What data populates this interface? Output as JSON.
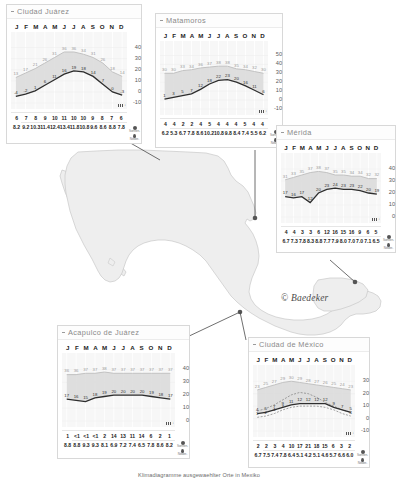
{
  "map": {
    "region_name": "Mexico",
    "copyright": "Baedeker",
    "copyright_mark": "©",
    "caption": "Klimadiagramme ausgewaehlter Orte in Mexiko"
  },
  "legend": {
    "sunshine_label": "Sonnen-\nstunden",
    "precip_label": "Nieder-\nschlag",
    "temp_max_label": "max",
    "temp_min_label": "min"
  },
  "icons": {
    "sun": "sun-icon",
    "raindrop": "raindrop-icon",
    "bars": "bars-icon",
    "arrow": "arrow-down-icon",
    "bullet": "bullet-marker"
  },
  "chart_data": [
    {
      "id": "ciudad-juarez",
      "type": "line",
      "title": "Ciudad Juárez",
      "categories": [
        "J",
        "F",
        "M",
        "A",
        "M",
        "J",
        "J",
        "A",
        "S",
        "O",
        "N",
        "D"
      ],
      "xlabel": "",
      "ylabel": "",
      "ylim": [
        -10,
        45
      ],
      "yticks": [
        -10,
        0,
        10,
        20,
        30,
        40
      ],
      "grid": true,
      "series": [
        {
          "name": "max",
          "values": [
            13,
            17,
            21,
            26,
            31,
            36,
            36,
            34,
            31,
            26,
            18,
            14
          ],
          "labels": [
            "13",
            "17",
            "21",
            "26",
            "31",
            "36",
            "36",
            "34",
            "31",
            "26",
            "18",
            "14"
          ]
        },
        {
          "name": "min",
          "values": [
            -4,
            -2,
            1,
            6,
            11,
            16,
            19,
            18,
            14,
            7,
            0,
            -3
          ],
          "labels": [
            "-4",
            "-2",
            "1",
            "6",
            "11",
            "16",
            "19",
            "18",
            "14",
            "7",
            "0",
            "-3"
          ]
        }
      ],
      "rows": [
        {
          "name": "sunshine",
          "values": [
            "6",
            "7",
            "8",
            "9",
            "10",
            "11",
            "10",
            "10",
            "9",
            "8",
            "7",
            "6"
          ]
        },
        {
          "name": "precip",
          "values": [
            "8.2",
            "9.2",
            "10.3",
            "11.4",
            "12.4",
            "13.4",
            "11.8",
            "10.8",
            "9.6",
            "8.6",
            "8.8",
            "7.8"
          ]
        }
      ]
    },
    {
      "id": "matamoros",
      "type": "line",
      "title": "Matamoros",
      "categories": [
        "J",
        "F",
        "M",
        "A",
        "M",
        "J",
        "J",
        "A",
        "S",
        "O",
        "N",
        "D"
      ],
      "xlabel": "",
      "ylabel": "",
      "ylim": [
        -10,
        55
      ],
      "yticks": [
        -10,
        0,
        10,
        20,
        30,
        40,
        50
      ],
      "grid": true,
      "values_note": "",
      "series": [
        {
          "name": "max",
          "values": [
            30,
            30,
            33,
            34,
            36,
            37,
            38,
            38,
            35,
            34,
            32,
            30
          ],
          "labels": [
            "30",
            "30",
            "33",
            "34",
            "36",
            "37",
            "38",
            "38",
            "35",
            "34",
            "32",
            "30"
          ]
        },
        {
          "name": "min",
          "values": [
            1,
            3,
            5,
            7,
            12,
            18,
            22,
            23,
            20,
            16,
            11,
            6
          ],
          "labels": [
            "1",
            "3",
            "5",
            "7",
            "12",
            "18",
            "22",
            "23",
            "20",
            "16",
            "11",
            "6"
          ]
        }
      ],
      "rows": [
        {
          "name": "sunshine",
          "values": [
            "4",
            "4",
            "2",
            "2",
            "4",
            "5",
            "4",
            "4",
            "4",
            "5",
            "4",
            "4"
          ]
        },
        {
          "name": "precip",
          "values": [
            "6.2",
            "5.3",
            "6.7",
            "7.8",
            "8.6",
            "10.2",
            "10.8",
            "9.8",
            "8.4",
            "7.4",
            "5.5",
            "6.2"
          ]
        }
      ]
    },
    {
      "id": "merida",
      "type": "line",
      "title": "Mérida",
      "categories": [
        "J",
        "F",
        "M",
        "A",
        "M",
        "J",
        "J",
        "A",
        "S",
        "O",
        "N",
        "D"
      ],
      "xlabel": "",
      "ylabel": "",
      "ylim": [
        0,
        45
      ],
      "yticks": [
        0,
        10,
        20,
        30,
        40
      ],
      "grid": true,
      "series": [
        {
          "name": "max",
          "values": [
            31,
            33,
            35,
            37,
            38,
            37,
            35,
            35,
            34,
            34,
            32,
            32
          ],
          "labels": [
            "31",
            "33",
            "35",
            "37",
            "38",
            "37",
            "35",
            "35",
            "34",
            "34",
            "32",
            "32"
          ]
        },
        {
          "name": "min",
          "values": [
            17,
            16,
            17,
            12,
            20,
            23,
            24,
            23,
            23,
            22,
            20,
            19
          ],
          "labels": [
            "17",
            "16",
            "17",
            "12",
            "20",
            "23",
            "24",
            "23",
            "23",
            "22",
            "20",
            "19"
          ]
        }
      ],
      "rows": [
        {
          "name": "sunshine",
          "values": [
            "4",
            "4",
            "3",
            "3",
            "6",
            "12",
            "16",
            "15",
            "16",
            "9",
            "6",
            "5"
          ]
        },
        {
          "name": "precip",
          "values": [
            "6.7",
            "7.3",
            "7.8",
            "8.3",
            "8.8",
            "7.7",
            "7.9",
            "8.0",
            "7.0",
            "7.0",
            "7.1",
            "6.5"
          ]
        }
      ]
    },
    {
      "id": "acapulco-de-juarez",
      "type": "line",
      "title": "Acapulco de Juárez",
      "categories": [
        "J",
        "F",
        "M",
        "A",
        "M",
        "J",
        "J",
        "A",
        "S",
        "O",
        "N",
        "D"
      ],
      "xlabel": "",
      "ylabel": "",
      "ylim": [
        0,
        45
      ],
      "yticks": [
        0,
        10,
        20,
        30,
        40
      ],
      "grid": true,
      "series": [
        {
          "name": "max",
          "values": [
            36,
            36,
            37,
            37,
            38,
            37,
            37,
            37,
            37,
            37,
            37,
            37
          ],
          "labels": [
            "36",
            "36",
            "37",
            "37",
            "38",
            "37",
            "37",
            "37",
            "37",
            "37",
            "37",
            "37"
          ]
        },
        {
          "name": "min",
          "values": [
            17,
            16,
            15,
            18,
            19,
            20,
            20,
            20,
            20,
            19,
            18,
            17
          ],
          "labels": [
            "17",
            "16",
            "15",
            "18",
            "19",
            "20",
            "20",
            "20",
            "20",
            "19",
            "18",
            "17"
          ]
        }
      ],
      "rows": [
        {
          "name": "sunshine",
          "values": [
            "1",
            "<1",
            "<1",
            "<1",
            "2",
            "14",
            "13",
            "11",
            "14",
            "6",
            "2",
            "1"
          ]
        },
        {
          "name": "precip",
          "values": [
            "8.8",
            "8.8",
            "9.3",
            "9.3",
            "8.1",
            "6.9",
            "7.2",
            "7.4",
            "6.5",
            "7.8",
            "8.6",
            "8.2"
          ]
        }
      ]
    },
    {
      "id": "ciudad-de-mexico",
      "type": "line",
      "title": "Ciudad de México",
      "categories": [
        "J",
        "F",
        "M",
        "A",
        "M",
        "J",
        "J",
        "A",
        "S",
        "O",
        "N",
        "D"
      ],
      "xlabel": "",
      "ylabel": "",
      "ylim": [
        -10,
        35
      ],
      "yticks": [
        -10,
        0,
        10,
        20,
        30
      ],
      "grid": true,
      "series": [
        {
          "name": "max",
          "values": [
            23,
            25,
            27,
            29,
            30,
            29,
            28,
            27,
            26,
            25,
            24,
            23
          ],
          "labels": [
            "23",
            "25",
            "27",
            "29",
            "30",
            "29",
            "28",
            "27",
            "26",
            "25",
            "24",
            "23"
          ]
        },
        {
          "name": "mean",
          "values": [
            6,
            8,
            11,
            15,
            19,
            21,
            20,
            17,
            13,
            10,
            7,
            5
          ],
          "labels": []
        },
        {
          "name": "min",
          "values": [
            4,
            5,
            7,
            9,
            11,
            12,
            12,
            12,
            12,
            9,
            7,
            5
          ],
          "labels": [
            "4",
            "5",
            "7",
            "9",
            "11",
            "12",
            "12",
            "12",
            "12",
            "9",
            "7",
            "5"
          ]
        },
        {
          "name": "min2",
          "values": [
            1,
            2,
            4,
            7,
            9,
            10,
            10,
            10,
            9,
            7,
            4,
            2
          ],
          "labels": [
            "1",
            "2",
            "4",
            "7",
            "",
            "",
            "",
            "",
            "",
            "",
            "",
            "4"
          ]
        }
      ],
      "rows": [
        {
          "name": "sunshine",
          "values": [
            "2",
            "2",
            "3",
            "4",
            "10",
            "17",
            "21",
            "18",
            "15",
            "6",
            "3",
            "2"
          ]
        },
        {
          "name": "precip",
          "values": [
            "6.7",
            "7.5",
            "7.4",
            "7.8",
            "6.4",
            "5.1",
            "4.2",
            "5.1",
            "4.6",
            "5.7",
            "6.6",
            "6.0"
          ]
        }
      ]
    }
  ]
}
